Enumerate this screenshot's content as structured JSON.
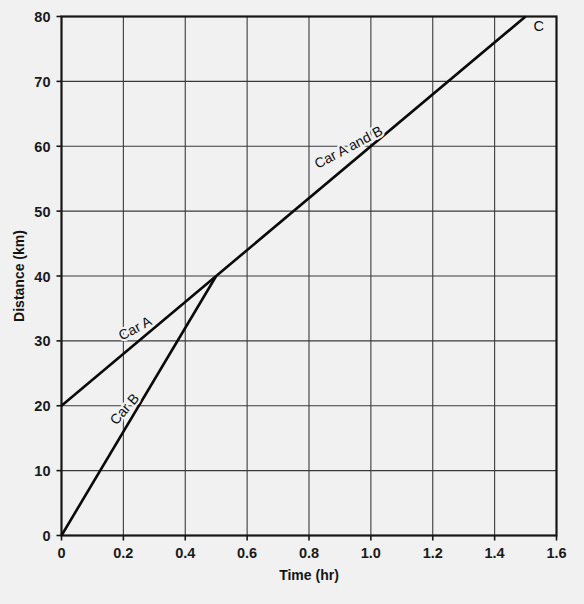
{
  "chart_data": {
    "type": "line",
    "title": "",
    "xlabel": "Time (hr)",
    "ylabel": "Distance (km)",
    "xlim": [
      0,
      1.6
    ],
    "ylim": [
      0,
      80
    ],
    "grid": true,
    "legend_position": "inline-labels",
    "x_ticks": [
      0,
      0.2,
      0.4,
      0.6,
      0.8,
      1.0,
      1.2,
      1.4,
      1.6
    ],
    "x_tick_labels": [
      "0",
      "0.2",
      "0.4",
      "0.6",
      "0.8",
      "1.0",
      "1.2",
      "1.4",
      "1.6"
    ],
    "y_ticks": [
      0,
      10,
      20,
      30,
      40,
      50,
      60,
      70,
      80
    ],
    "y_tick_labels": [
      "0",
      "10",
      "20",
      "30",
      "40",
      "50",
      "60",
      "70",
      "80"
    ],
    "series": [
      {
        "name": "Car A",
        "x": [
          0,
          0.5
        ],
        "values": [
          20,
          40
        ],
        "label": "Car A",
        "label_at": {
          "x": 0.245,
          "y": 31.3
        },
        "label_angle": -28
      },
      {
        "name": "Car B",
        "x": [
          0,
          0.5
        ],
        "values": [
          0,
          40
        ],
        "label": "Car B",
        "label_at": {
          "x": 0.215,
          "y": 19.0
        },
        "label_angle": -49
      },
      {
        "name": "Car A and B",
        "x": [
          0.5,
          1.5
        ],
        "values": [
          40,
          80
        ],
        "label": "Car A and B",
        "label_at": {
          "x": 0.935,
          "y": 59.2
        },
        "label_angle": -28
      }
    ],
    "annotations": [
      {
        "text": "C",
        "x": 1.5,
        "y": 80,
        "dx": 8,
        "dy": 14
      }
    ]
  },
  "colors": {
    "background": "#f1f1f1",
    "axis": "#161616",
    "grid": "#3a3a3a",
    "line": "#0a0a0a",
    "text": "#141414"
  }
}
